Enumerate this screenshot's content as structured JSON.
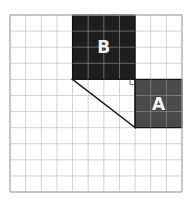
{
  "diagram": {
    "grid": {
      "cols": 11,
      "rows": 11,
      "line_color": "#c8c8c8",
      "border_color": "#b0b0b0"
    },
    "squares": [
      {
        "label": "B",
        "col": 4,
        "row": 0,
        "size": 4,
        "fill": "#1e1e1e",
        "label_color": "#f2f2f2"
      },
      {
        "label": "A",
        "col": 8,
        "row": 4,
        "size": 3,
        "fill": "#4a4a4a",
        "label_color": "#f2f2f2"
      }
    ],
    "triangle": {
      "vertices": [
        [
          4,
          4
        ],
        [
          8,
          4
        ],
        [
          8,
          7
        ]
      ],
      "right_angle_at": [
        8,
        4
      ],
      "stroke": "#1a1a1a"
    }
  }
}
